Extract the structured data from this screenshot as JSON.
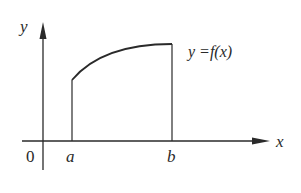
{
  "diagram": {
    "axes": {
      "x_label": "x",
      "y_label": "y",
      "origin_label": "0"
    },
    "bounds": {
      "left_label": "a",
      "right_label": "b"
    },
    "curve": {
      "label": "y =f(x)",
      "shape": "increasing concave-down arc from x=a to x=b"
    },
    "colors": {
      "stroke": "#2a2a2a",
      "background": "#ffffff"
    }
  }
}
